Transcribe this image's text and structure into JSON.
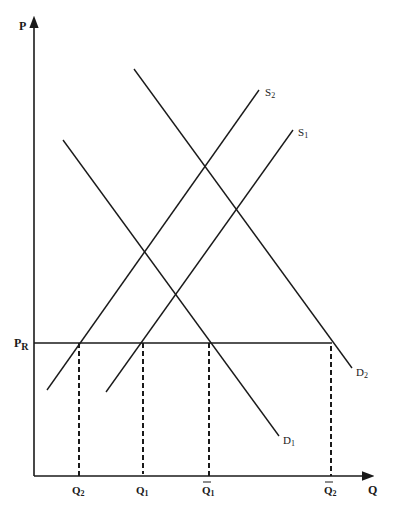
{
  "diagram": {
    "type": "supply-demand",
    "axes": {
      "y_label": "P",
      "x_label": "Q"
    },
    "price_line": {
      "label": "P",
      "label_sub": "R"
    },
    "curves": {
      "S1": {
        "label": "S",
        "sub": "1"
      },
      "S2": {
        "label": "S",
        "sub": "2"
      },
      "D1": {
        "label": "D",
        "sub": "1"
      },
      "D2": {
        "label": "D",
        "sub": "2"
      }
    },
    "quantity_labels": [
      {
        "label": "Q",
        "sub": "2",
        "bar": false
      },
      {
        "label": "Q",
        "sub": "1",
        "bar": false
      },
      {
        "label": "Q",
        "sub": "1",
        "bar": true
      },
      {
        "label": "Q",
        "sub": "2",
        "bar": true
      }
    ],
    "colors": {
      "line": "#1a1a1a",
      "background": "#ffffff"
    }
  }
}
